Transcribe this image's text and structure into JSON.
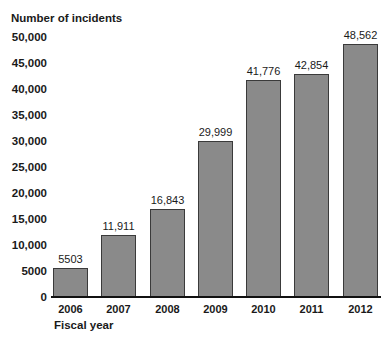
{
  "chart_data": {
    "type": "bar",
    "title": "",
    "ylabel": "Number of incidents",
    "xlabel": "Fiscal year",
    "categories": [
      "2006",
      "2007",
      "2008",
      "2009",
      "2010",
      "2011",
      "2012"
    ],
    "values": [
      5503,
      11911,
      16843,
      29999,
      41776,
      42854,
      48562
    ],
    "value_labels": [
      "5503",
      "11,911",
      "16,843",
      "29,999",
      "41,776",
      "42,854",
      "48,562"
    ],
    "yticks": [
      "0",
      "5000",
      "10,000",
      "15,000",
      "20,000",
      "25,000",
      "30,000",
      "35,000",
      "40,000",
      "45,000",
      "50,000"
    ],
    "ylim": [
      0,
      50000
    ],
    "grid": false,
    "bar_color": "#8a8a8a"
  }
}
